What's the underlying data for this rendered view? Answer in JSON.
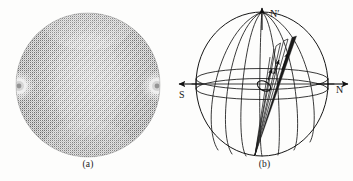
{
  "figure": {
    "kind": "two-panel scientific figure",
    "background_color": "#fdfdfc",
    "ink_color": "#1a1a1a"
  },
  "panels": [
    {
      "id": "a",
      "caption": "(a)",
      "type": "halftone-textured-disk",
      "description": "dotted grayscale droplet texture with two bright point defects on the horizontal diameter",
      "disk": {
        "center_x": 88,
        "center_y": 85,
        "radius": 72,
        "fill_gray": "#9b9b9b"
      },
      "defects": [
        {
          "name": "left-defect",
          "cx": 19,
          "cy": 86,
          "r": 9
        },
        {
          "name": "right-defect",
          "cx": 157,
          "cy": 86,
          "r": 9
        }
      ]
    },
    {
      "id": "b",
      "caption": "(b)",
      "type": "sphere-director-field-diagram",
      "sphere": {
        "center_x": 86,
        "center_y": 84,
        "rx": 66,
        "ry": 72
      },
      "equator": {
        "rx": 66,
        "ry": 11,
        "band_offset": 5
      },
      "meridian_count": 7,
      "labels": [
        {
          "name": "north-prime-label",
          "text": "N′",
          "x": 95,
          "y": 14
        },
        {
          "name": "south-label",
          "text": "S",
          "x": 5,
          "y": 95
        },
        {
          "name": "north-label",
          "text": "N",
          "x": 160,
          "y": 92
        }
      ],
      "arrows": [
        {
          "name": "polar-axis-arrow",
          "direction": "up",
          "from": [
            86,
            30
          ],
          "to": [
            86,
            6
          ]
        },
        {
          "name": "south-axis-arrow",
          "direction": "left",
          "from": [
            30,
            84
          ],
          "to": [
            2,
            84
          ]
        },
        {
          "name": "north-axis-arrow",
          "direction": "right",
          "from": [
            140,
            84
          ],
          "to": [
            172,
            84
          ]
        }
      ],
      "director_cone": {
        "name": "director-cone",
        "apex": [
          79,
          155
        ],
        "tip": [
          121,
          36
        ],
        "arrow_count": 3,
        "core_loop": {
          "cx": 88,
          "cy": 86,
          "rx": 5,
          "ry": 7,
          "rotate": -62
        }
      }
    }
  ]
}
